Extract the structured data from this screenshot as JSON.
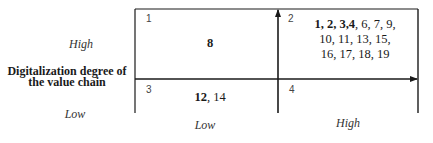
{
  "diagram": {
    "type": "2x2-matrix",
    "y_axis": {
      "title_line1": "Digitalization degree of",
      "title_line2": "the value chain",
      "high_label": "High",
      "low_label": "Low"
    },
    "x_axis": {
      "title": "",
      "low_label": "Low",
      "high_label": "High"
    },
    "quadrants": [
      {
        "number": "1",
        "position": "top-left",
        "bold_items": "8",
        "items": ""
      },
      {
        "number": "2",
        "position": "top-right",
        "bold_items": "1, 2, 3,4",
        "items_line1": ", 6, 7, 9,",
        "items_line2": "10, 11, 13, 15,",
        "items_line3": "16, 17, 18, 19"
      },
      {
        "number": "3",
        "position": "bottom-left",
        "bold_items": "12",
        "items": ", 14"
      },
      {
        "number": "4",
        "position": "bottom-right",
        "bold_items": "",
        "items": ""
      }
    ],
    "colors": {
      "line": "#1a1a1a",
      "text": "#1a1a1a",
      "background": "#ffffff"
    }
  }
}
